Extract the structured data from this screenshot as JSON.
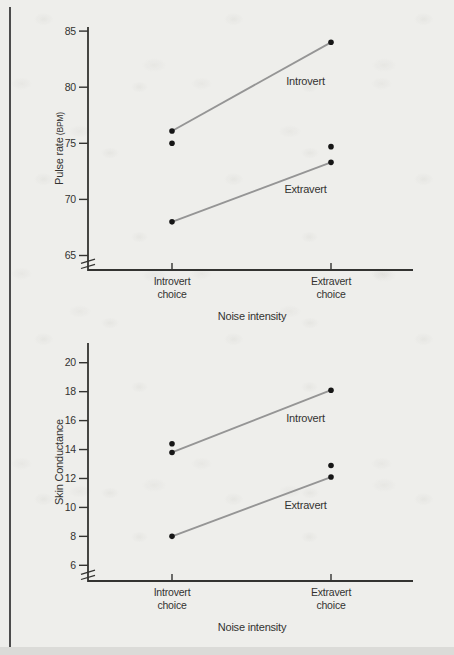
{
  "page": {
    "background_color": "#eeeeeb",
    "margin_rule_color": "#4c4c4c",
    "bottom_edge_color": "#dbdbd8"
  },
  "chart_data": [
    {
      "type": "line",
      "title": "",
      "ylabel": "Pulse rate",
      "ylabel_suffix": "(BPM)",
      "xlabel": "Noise intensity",
      "categories": [
        "Introvert\nchoice",
        "Extravert\nchoice"
      ],
      "yticks": [
        65,
        70,
        75,
        80,
        85
      ],
      "ylim": [
        63.5,
        85.5
      ],
      "axis_break": true,
      "grid": false,
      "legend_position": "inline-labels",
      "series": [
        {
          "name": "Introvert",
          "values": [
            76.1,
            84.0
          ],
          "label_anchor": {
            "x_frac": 0.84,
            "value": 80.2
          }
        },
        {
          "name": "Extravert",
          "values": [
            68.0,
            73.3
          ],
          "label_anchor": {
            "x_frac": 0.84,
            "value": 70.6
          }
        }
      ],
      "extra_points": [
        {
          "category_index": 0,
          "value": 75.0
        },
        {
          "category_index": 1,
          "value": 74.7
        }
      ],
      "colors": {
        "line": "#959595",
        "point": "#161616",
        "axis": "#333331",
        "text": "#333331"
      }
    },
    {
      "type": "line",
      "title": "",
      "ylabel": "Skin Conductance",
      "ylabel_suffix": "",
      "xlabel": "Noise intensity",
      "categories": [
        "Introvert\nchoice",
        "Extravert\nchoice"
      ],
      "yticks": [
        6,
        8,
        10,
        12,
        14,
        16,
        18,
        20
      ],
      "ylim": [
        4.9,
        21.4
      ],
      "axis_break": true,
      "grid": false,
      "legend_position": "inline-labels",
      "series": [
        {
          "name": "Introvert",
          "values": [
            13.8,
            18.1
          ],
          "label_anchor": {
            "x_frac": 0.84,
            "value": 15.9
          }
        },
        {
          "name": "Extravert",
          "values": [
            8.0,
            12.1
          ],
          "label_anchor": {
            "x_frac": 0.84,
            "value": 9.9
          }
        }
      ],
      "extra_points": [
        {
          "category_index": 0,
          "value": 14.4
        },
        {
          "category_index": 1,
          "value": 12.9
        }
      ],
      "colors": {
        "line": "#959595",
        "point": "#161616",
        "axis": "#333331",
        "text": "#333331"
      }
    }
  ]
}
